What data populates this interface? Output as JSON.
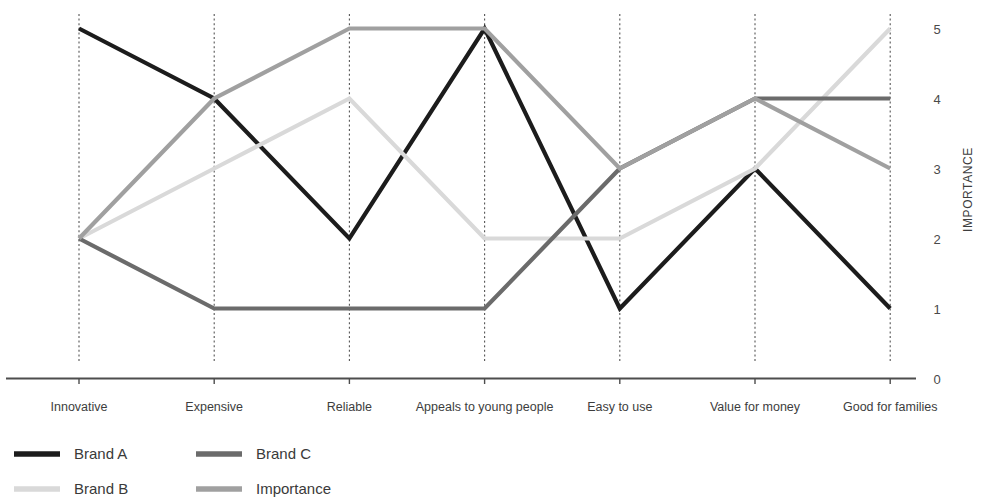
{
  "chart_data": {
    "type": "line",
    "subtype": "parallel-coordinates",
    "title": "",
    "xlabel": "",
    "ylabel": "IMPORTANCE",
    "ylim": [
      0,
      5
    ],
    "ytick_labels": [
      "0",
      "1",
      "2",
      "3",
      "4",
      "5"
    ],
    "ytick_values": [
      0,
      1,
      2,
      3,
      4,
      5
    ],
    "grid": false,
    "vertical_axes": true,
    "legend_position": "bottom-left",
    "categories": [
      "Innovative",
      "Expensive",
      "Reliable",
      "Appeals to young people",
      "Easy to use",
      "Value for money",
      "Good for families"
    ],
    "series": [
      {
        "name": "Brand  A",
        "color": "#1c1c1c",
        "values": [
          5,
          4,
          2,
          5,
          1,
          3,
          1
        ]
      },
      {
        "name": "Brand  B",
        "color": "#d9d9d9",
        "values": [
          2,
          3,
          4,
          2,
          2,
          3,
          5
        ]
      },
      {
        "name": "Brand  C",
        "color": "#6b6b6b",
        "values": [
          2,
          1,
          1,
          1,
          3,
          4,
          4
        ]
      },
      {
        "name": "Importance",
        "color": "#a0a0a0",
        "values": [
          2,
          4,
          5,
          5,
          3,
          4,
          3
        ]
      }
    ]
  },
  "axis": {
    "y_title": "IMPORTANCE",
    "ticks": [
      "5",
      "4",
      "3",
      "2",
      "1",
      "0"
    ]
  },
  "legend": {
    "entries": [
      {
        "label": "Brand  A",
        "color": "#1c1c1c"
      },
      {
        "label": "Brand  B",
        "color": "#d9d9d9"
      },
      {
        "label": "Brand  C",
        "color": "#6b6b6b"
      },
      {
        "label": "Importance",
        "color": "#a0a0a0"
      }
    ]
  }
}
